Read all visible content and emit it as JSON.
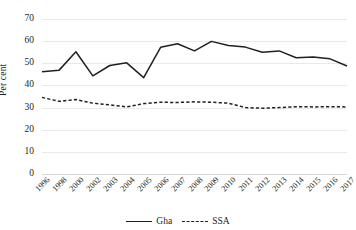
{
  "chart_data": {
    "type": "line",
    "title": "",
    "xlabel": "",
    "ylabel": "Per cent",
    "ylim": [
      0,
      70
    ],
    "ytick_step": 10,
    "grid": true,
    "legend_position": "bottom",
    "categories": [
      "1996",
      "1998",
      "2000",
      "2002",
      "2003",
      "2004",
      "2005",
      "2006",
      "2007",
      "2008",
      "2009",
      "2010",
      "2011",
      "2012",
      "2013",
      "2014",
      "2015",
      "2016",
      "2017"
    ],
    "series": [
      {
        "name": "Gha",
        "style": "solid",
        "color": "#231f20",
        "values": [
          46.2,
          46.8,
          55.2,
          44.3,
          49.0,
          50.2,
          43.5,
          57.2,
          58.8,
          55.6,
          59.9,
          58.0,
          57.3,
          55.0,
          55.6,
          52.5,
          52.8,
          52.0,
          48.8
        ]
      },
      {
        "name": "SSA",
        "style": "dashed",
        "color": "#231f20",
        "values": [
          34.6,
          32.8,
          33.6,
          32.0,
          31.2,
          30.3,
          31.8,
          32.4,
          32.3,
          32.6,
          32.4,
          32.0,
          30.0,
          29.7,
          30.0,
          30.4,
          30.3,
          30.4,
          30.3
        ]
      }
    ],
    "yticks": [
      "0",
      "10",
      "20",
      "30",
      "40",
      "50",
      "60",
      "70"
    ]
  },
  "axis": {
    "y_title": "Per cent"
  },
  "legend": {
    "items": [
      {
        "label": "Gha"
      },
      {
        "label": "SSA"
      }
    ]
  }
}
